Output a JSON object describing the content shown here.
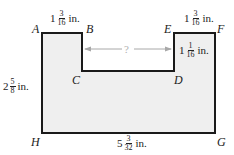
{
  "diagram": {
    "fill_color": "#efefef",
    "stroke_color": "#1a1a1a",
    "arrow_color": "#a8a8a8",
    "vertices": {
      "A": "A",
      "B": "B",
      "C": "C",
      "D": "D",
      "E": "E",
      "F": "F",
      "G": "G",
      "H": "H"
    },
    "measurements": {
      "AB": {
        "whole": "1",
        "num": "3",
        "den": "16",
        "unit": "in."
      },
      "EF": {
        "whole": "1",
        "num": "3",
        "den": "16",
        "unit": "in."
      },
      "DE": {
        "whole": "1",
        "num": "1",
        "den": "16",
        "unit": "in."
      },
      "AH": {
        "whole": "2",
        "num": "5",
        "den": "8",
        "unit": "in."
      },
      "HG": {
        "whole": "5",
        "num": "3",
        "den": "32",
        "unit": "in."
      }
    },
    "unknown_label": "?"
  }
}
